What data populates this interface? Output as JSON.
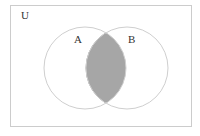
{
  "diagram": {
    "type": "venn",
    "universe": {
      "label": "U",
      "x": 10,
      "y": 5,
      "width": 182,
      "height": 122,
      "stroke": "#cccccc"
    },
    "sets": [
      {
        "label": "A",
        "cx": 85,
        "cy": 68,
        "r": 41,
        "label_x": 74,
        "label_y": 43
      },
      {
        "label": "B",
        "cx": 127,
        "cy": 68,
        "r": 41,
        "label_x": 128,
        "label_y": 43
      }
    ],
    "shaded_region": "A ∩ B",
    "colors": {
      "shade": "#a6a6a6",
      "circle_stroke": "#cfcfcf",
      "lens_stroke": "#8a8a8a",
      "text": "#333333"
    }
  }
}
